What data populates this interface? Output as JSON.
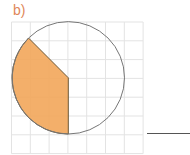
{
  "question": {
    "label": "b)"
  },
  "diagram": {
    "grid": {
      "x0": 11.5,
      "y0": 22,
      "cell": 18.8,
      "cols": 7,
      "rows": 7,
      "line_color": "#e3e3e3"
    },
    "circle": {
      "cx": 68.3,
      "cy": 77.8,
      "r": 56.2,
      "stroke": "#777777"
    },
    "shaded_sector": {
      "fill": "#f2a65a",
      "stroke": "#6e5a3a",
      "from_angle_deg": 135,
      "to_angle_deg": 270,
      "description": "shaded sector from upper-left point on circle, through center, down to bottom"
    }
  },
  "answer": {
    "line_x1": 147,
    "line_x2": 190,
    "line_y": 133.5,
    "value": ""
  }
}
